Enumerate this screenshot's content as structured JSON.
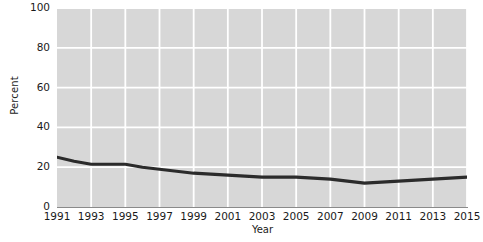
{
  "chart_data": {
    "type": "line",
    "title": "",
    "xlabel": "Year",
    "ylabel": "Percent",
    "xlim": [
      1991,
      2015
    ],
    "ylim": [
      0,
      100
    ],
    "grid": true,
    "legend": "none",
    "y_ticks": [
      "0",
      "20",
      "40",
      "60",
      "80",
      "100"
    ],
    "y_tick_values": [
      0,
      20,
      40,
      60,
      80,
      100
    ],
    "x_ticks": [
      "1991",
      "1993",
      "1995",
      "1997",
      "1999",
      "2001",
      "2003",
      "2005",
      "2007",
      "2009",
      "2011",
      "2013",
      "2015"
    ],
    "x_tick_values": [
      1991,
      1993,
      1995,
      1997,
      1999,
      2001,
      2003,
      2005,
      2007,
      2009,
      2011,
      2013,
      2015
    ],
    "x": [
      1991,
      1992,
      1993,
      1994,
      1995,
      1996,
      1997,
      1998,
      1999,
      2000,
      2001,
      2002,
      2003,
      2004,
      2005,
      2006,
      2007,
      2008,
      2009,
      2010,
      2011,
      2012,
      2013,
      2014,
      2015
    ],
    "values": [
      25,
      23,
      21.5,
      21.5,
      21.5,
      20,
      19,
      18,
      17,
      16.5,
      16,
      15.5,
      15,
      15,
      15,
      14.5,
      14,
      13,
      12,
      12.5,
      13,
      13.5,
      14,
      14.5,
      15
    ],
    "series": [
      {
        "name": "Percent",
        "color": "#2b2b2b",
        "values": [
          25,
          23,
          21.5,
          21.5,
          21.5,
          20,
          19,
          18,
          17,
          16.5,
          16,
          15.5,
          15,
          15,
          15,
          14.5,
          14,
          13,
          12,
          12.5,
          13,
          13.5,
          14,
          14.5,
          15
        ]
      }
    ],
    "colors": {
      "plot_background": "#d7d7d7",
      "gridline": "#ffffff",
      "line": "#2b2b2b",
      "axis": "#8a8a8a",
      "page_background": "#ffffff",
      "text": "#1a1a1a"
    }
  }
}
